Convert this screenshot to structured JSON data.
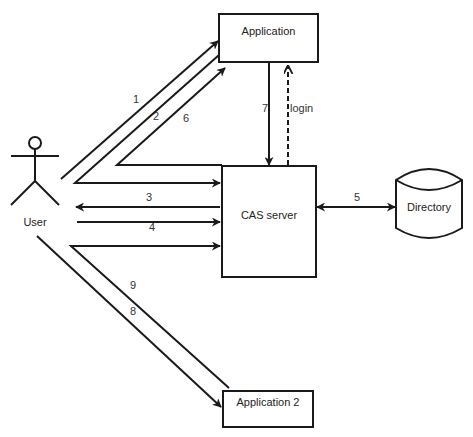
{
  "diagram": {
    "nodes": {
      "user": {
        "label": "User",
        "shape": "stick-figure"
      },
      "application": {
        "label": "Application",
        "shape": "rectangle"
      },
      "cas_server": {
        "label": "CAS server",
        "shape": "rectangle"
      },
      "directory": {
        "label": "Directory",
        "shape": "cylinder"
      },
      "application2": {
        "label": "Application 2",
        "shape": "rectangle"
      }
    },
    "edges": [
      {
        "id": "1",
        "label": "1",
        "from": "User",
        "to": "Application",
        "style": "solid"
      },
      {
        "id": "2",
        "label": "2",
        "from": "Application",
        "to": "CAS server",
        "via": "User",
        "style": "solid"
      },
      {
        "id": "3",
        "label": "3",
        "from": "CAS server",
        "to": "User",
        "style": "solid"
      },
      {
        "id": "4",
        "label": "4",
        "from": "User",
        "to": "CAS server",
        "style": "solid"
      },
      {
        "id": "5",
        "label": "5",
        "from": "CAS server",
        "to": "Directory",
        "style": "solid",
        "bidirectional": true
      },
      {
        "id": "6",
        "label": "6",
        "from": "CAS server",
        "to": "Application",
        "via": "User",
        "style": "solid"
      },
      {
        "id": "7",
        "label": "7",
        "from": "Application",
        "to": "CAS server",
        "style": "solid"
      },
      {
        "id": "login",
        "label": "login",
        "from": "CAS server",
        "to": "Application",
        "style": "dashed"
      },
      {
        "id": "8",
        "label": "8",
        "from": "User",
        "to": "Application 2",
        "style": "solid"
      },
      {
        "id": "9",
        "label": "9",
        "from": "Application 2",
        "to": "CAS server",
        "via": "User",
        "style": "solid"
      }
    ],
    "colors": {
      "stroke": "#1a1a1a",
      "background": "#ffffff",
      "text": "#222222"
    }
  }
}
